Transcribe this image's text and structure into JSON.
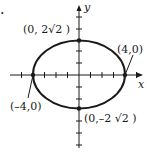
{
  "figure": {
    "marker": ".",
    "type": "ellipse",
    "equation_params": {
      "a": 4,
      "b": "2√2"
    },
    "axes": {
      "x_label": "x",
      "y_label": "y"
    },
    "points": [
      {
        "label": "(0, 2√2 )",
        "x": 0,
        "y": 2.828
      },
      {
        "label": "(4,0)",
        "x": 4,
        "y": 0
      },
      {
        "label": "(–4,0)",
        "x": -4,
        "y": 0
      },
      {
        "label": "(0,–2 √2 )",
        "x": 0,
        "y": -2.828
      }
    ],
    "colors": {
      "stroke": "#1a1a1a",
      "background": "#ffffff"
    }
  }
}
